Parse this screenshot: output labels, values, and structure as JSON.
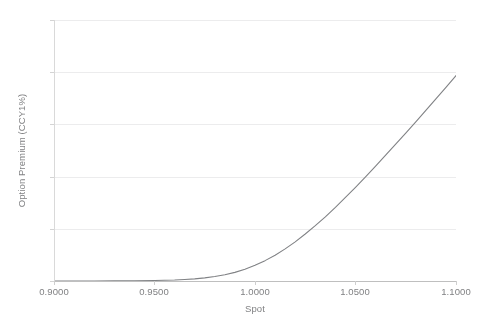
{
  "chart_data": {
    "type": "line",
    "title": "",
    "xlabel": "Spot",
    "ylabel": "Option Premium (CCY1%)",
    "xlim": [
      0.9,
      1.1
    ],
    "ylim": [
      0,
      0.1
    ],
    "grid": true,
    "legend": false,
    "legend_position": "none",
    "xticks": [
      0.9,
      0.95,
      1.0,
      1.05,
      1.1
    ],
    "xticklabels": [
      "0.9000",
      "0.9500",
      "1.0000",
      "1.0500",
      "1.1000"
    ],
    "yticks": [
      0,
      0.02,
      0.04,
      0.06,
      0.08,
      0.1
    ],
    "yticklabels": [
      "0%",
      "2%",
      "4%",
      "6%",
      "8%",
      "10%"
    ],
    "line_color": "#808285",
    "line_width": 1.1,
    "series": [
      {
        "name": "Option Premium",
        "x": [
          0.9,
          0.91,
          0.92,
          0.93,
          0.94,
          0.95,
          0.955,
          0.96,
          0.965,
          0.97,
          0.975,
          0.98,
          0.985,
          0.99,
          0.995,
          1.0,
          1.005,
          1.01,
          1.015,
          1.02,
          1.025,
          1.03,
          1.035,
          1.04,
          1.045,
          1.05,
          1.055,
          1.06,
          1.065,
          1.07,
          1.075,
          1.08,
          1.085,
          1.09,
          1.095,
          1.1
        ],
        "values": [
          0.0,
          0.0,
          0.0,
          0.0001,
          0.0001,
          0.0002,
          0.0003,
          0.0004,
          0.0006,
          0.0008,
          0.0012,
          0.0017,
          0.0024,
          0.0033,
          0.0045,
          0.006,
          0.0078,
          0.0099,
          0.0123,
          0.015,
          0.018,
          0.0212,
          0.0246,
          0.0282,
          0.032,
          0.0359,
          0.0399,
          0.044,
          0.0482,
          0.0524,
          0.0567,
          0.061,
          0.0654,
          0.0698,
          0.0742,
          0.0787
        ]
      }
    ],
    "annotations": []
  },
  "axes": {
    "x_title": "Spot",
    "y_title": "Option Premium (CCY1%)"
  },
  "ticks": {
    "y": [
      {
        "label": "10%"
      },
      {
        "label": "8%"
      },
      {
        "label": "6%"
      },
      {
        "label": "4%"
      },
      {
        "label": "2%"
      },
      {
        "label": "0%"
      }
    ],
    "x": [
      {
        "label": "0.9000"
      },
      {
        "label": "0.9500"
      },
      {
        "label": "1.0000"
      },
      {
        "label": "1.0500"
      },
      {
        "label": "1.1000"
      }
    ]
  },
  "colors": {
    "line": "#808285",
    "grid": "#ececed",
    "axis": "#bfbfbf",
    "text": "#808183",
    "background": "#ffffff"
  }
}
